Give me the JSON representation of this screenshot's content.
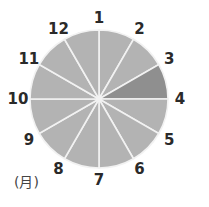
{
  "chart_data": {
    "type": "pie",
    "title": "",
    "unit_label": "(月)",
    "center": [
      99,
      99
    ],
    "radius": 69,
    "boundary_labels": [
      "1",
      "2",
      "3",
      "4",
      "5",
      "6",
      "7",
      "8",
      "9",
      "10",
      "11",
      "12"
    ],
    "segments": [
      {
        "from": "1",
        "to": "2",
        "value": 1,
        "highlighted": false
      },
      {
        "from": "2",
        "to": "3",
        "value": 1,
        "highlighted": false
      },
      {
        "from": "3",
        "to": "4",
        "value": 1,
        "highlighted": true
      },
      {
        "from": "4",
        "to": "5",
        "value": 1,
        "highlighted": false
      },
      {
        "from": "5",
        "to": "6",
        "value": 1,
        "highlighted": false
      },
      {
        "from": "6",
        "to": "7",
        "value": 1,
        "highlighted": false
      },
      {
        "from": "7",
        "to": "8",
        "value": 1,
        "highlighted": false
      },
      {
        "from": "8",
        "to": "9",
        "value": 1,
        "highlighted": false
      },
      {
        "from": "9",
        "to": "10",
        "value": 1,
        "highlighted": false
      },
      {
        "from": "10",
        "to": "11",
        "value": 1,
        "highlighted": false
      },
      {
        "from": "11",
        "to": "12",
        "value": 1,
        "highlighted": false
      },
      {
        "from": "12",
        "to": "1",
        "value": 1,
        "highlighted": false
      }
    ],
    "colors": {
      "segment": "#b3b3b3",
      "highlight": "#8f8f8f",
      "divider": "#f2f2f2",
      "label": "#2a2a2a"
    }
  }
}
